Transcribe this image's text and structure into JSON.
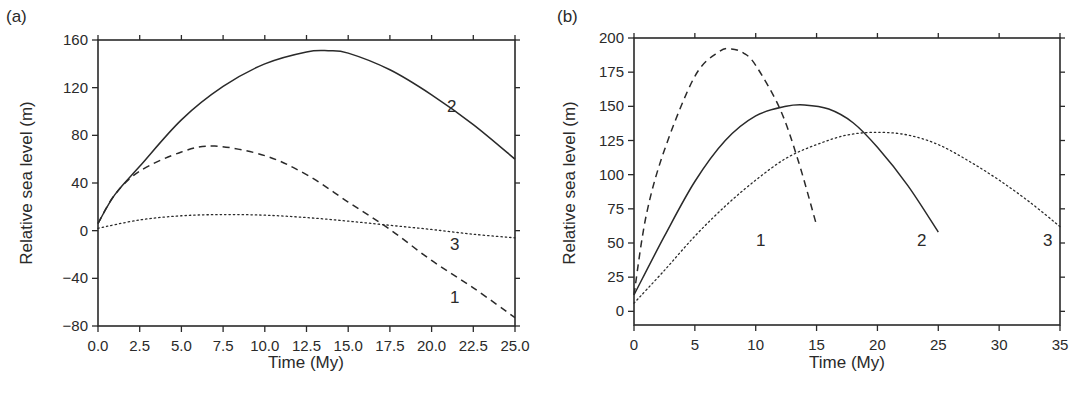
{
  "chart_data": [
    {
      "panel": "(a)",
      "type": "line",
      "title": "",
      "xlabel": "Time (My)",
      "ylabel": "Relative sea level (m)",
      "xlim": [
        0,
        25
      ],
      "ylim": [
        -80,
        160
      ],
      "xticks": [
        "0.0",
        "2.5",
        "5.0",
        "7.5",
        "10.0",
        "12.5",
        "15.0",
        "17.5",
        "20.0",
        "22.5",
        "25.0"
      ],
      "yticks": [
        "-80",
        "-40",
        "0",
        "40",
        "80",
        "120",
        "160"
      ],
      "grid": false,
      "legend": "inline curve labels",
      "series": [
        {
          "name": "1",
          "style": "dashed",
          "x": [
            0,
            1,
            2.5,
            5,
            7,
            10,
            12.5,
            15,
            17.5,
            20,
            22.5,
            25
          ],
          "y": [
            6,
            30,
            50,
            66,
            71,
            63,
            47,
            24,
            1,
            -25,
            -48,
            -73
          ]
        },
        {
          "name": "2",
          "style": "solid",
          "x": [
            0,
            1,
            2.5,
            5,
            7.5,
            10,
            12.5,
            13.8,
            15,
            17.5,
            20,
            22.5,
            25
          ],
          "y": [
            6,
            30,
            54,
            93,
            121,
            140,
            150,
            151,
            149,
            135,
            114,
            89,
            60
          ]
        },
        {
          "name": "3",
          "style": "dotted",
          "x": [
            0,
            2.5,
            5,
            7.5,
            10,
            12.5,
            15,
            17.5,
            20,
            22.5,
            25
          ],
          "y": [
            2,
            9,
            12.5,
            13.5,
            13,
            11,
            8,
            4.5,
            1,
            -3,
            -6
          ]
        }
      ],
      "annotations": [
        "1",
        "2",
        "3"
      ]
    },
    {
      "panel": "(b)",
      "type": "line",
      "title": "",
      "xlabel": "Time (My)",
      "ylabel": "Relative sea level (m)",
      "xlim": [
        0,
        35
      ],
      "ylim": [
        -10,
        200
      ],
      "xticks": [
        "0",
        "5",
        "10",
        "15",
        "20",
        "25",
        "30",
        "35"
      ],
      "yticks": [
        "0",
        "25",
        "50",
        "75",
        "100",
        "125",
        "150",
        "175",
        "200"
      ],
      "grid": false,
      "legend": "inline curve labels",
      "series": [
        {
          "name": "1",
          "style": "dashed",
          "x": [
            0,
            1,
            2.5,
            5,
            7,
            8,
            9,
            10,
            12,
            13.5,
            15
          ],
          "y": [
            12,
            70,
            118,
            172,
            190,
            192,
            189,
            180,
            148,
            110,
            63
          ]
        },
        {
          "name": "2",
          "style": "solid",
          "x": [
            0,
            2.5,
            5,
            7.5,
            10,
            12.5,
            14,
            16,
            18,
            20,
            22.5,
            25
          ],
          "y": [
            12,
            55,
            95,
            125,
            143,
            150,
            151,
            148,
            138,
            120,
            92,
            58
          ]
        },
        {
          "name": "3",
          "style": "dotted",
          "x": [
            0,
            2.5,
            5,
            7.5,
            10,
            12.5,
            15,
            17.5,
            20,
            22.5,
            25,
            27.5,
            30,
            32.5,
            35
          ],
          "y": [
            6,
            30,
            55,
            77,
            96,
            112,
            122,
            129,
            131,
            129,
            122,
            110,
            96,
            80,
            62
          ]
        }
      ],
      "annotations": [
        "1",
        "2",
        "3"
      ]
    }
  ],
  "labels": {
    "panel_a": "(a)",
    "panel_b": "(b)",
    "xlabel": "Time (My)",
    "ylabel": "Relative sea level (m)"
  }
}
